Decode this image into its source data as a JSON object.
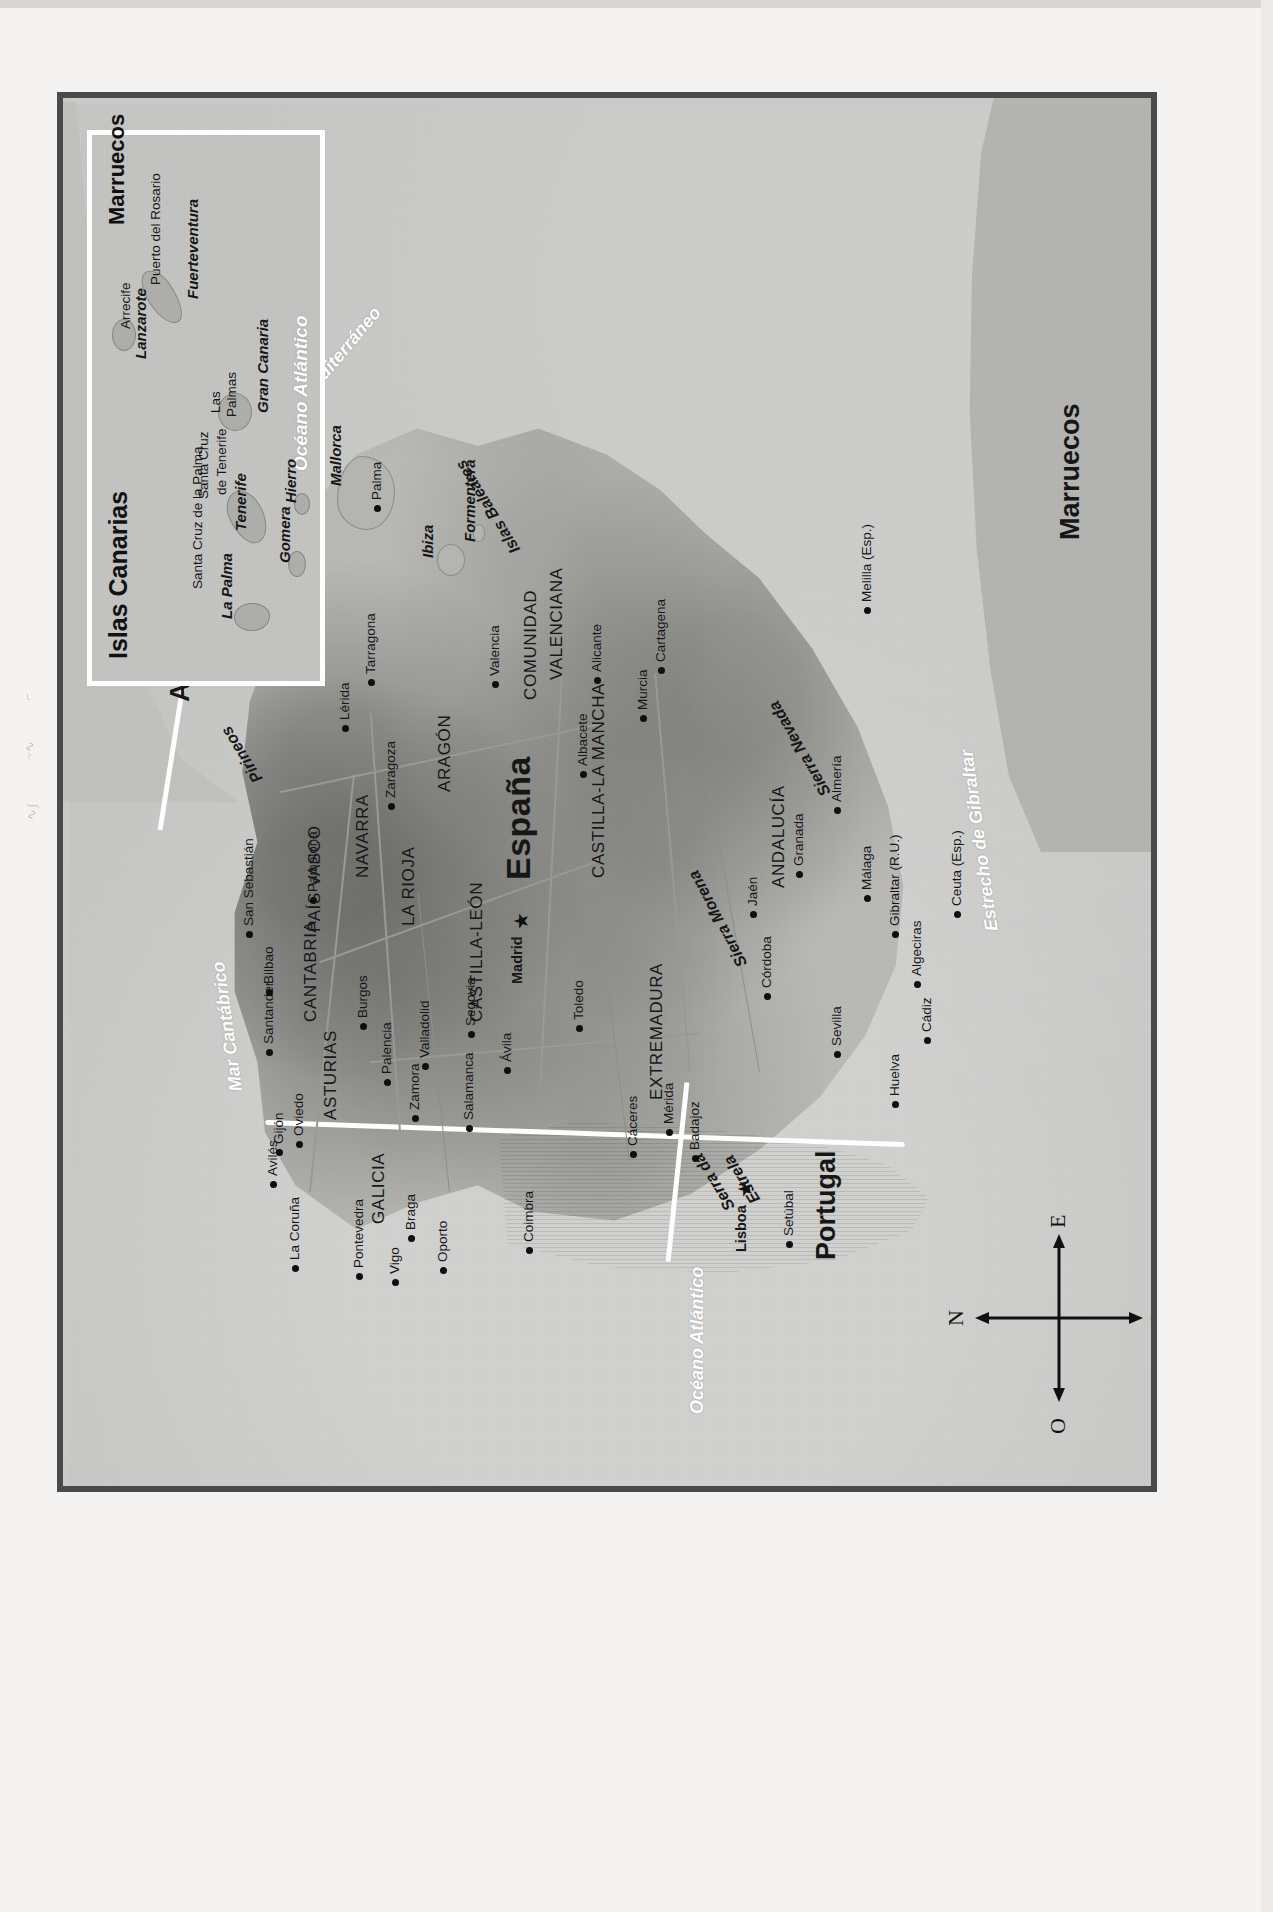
{
  "map": {
    "title": "Mapa físico-político de España y Portugal",
    "countries": [
      {
        "name": "España",
        "x": 612,
        "y": 430
      },
      {
        "name": "Portugal",
        "x": 232,
        "y": 742
      },
      {
        "name": "Andorra",
        "x": 790,
        "y": 96
      },
      {
        "name": "Marruecos",
        "x": 952,
        "y": 986
      }
    ],
    "regions": [
      {
        "name": "GALICIA",
        "x": 268,
        "y": 300
      },
      {
        "name": "ASTURIAS",
        "x": 372,
        "y": 252
      },
      {
        "name": "CANTABRIA",
        "x": 470,
        "y": 232
      },
      {
        "name": "PAÍS VASCO",
        "x": 560,
        "y": 236
      },
      {
        "name": "NAVARRA",
        "x": 614,
        "y": 284
      },
      {
        "name": "LA RIOJA",
        "x": 566,
        "y": 330
      },
      {
        "name": "ARAGÓN",
        "x": 700,
        "y": 366
      },
      {
        "name": "CATALUÑA",
        "x": 806,
        "y": 212
      },
      {
        "name": "CASTILLA-LEÓN",
        "x": 470,
        "y": 398
      },
      {
        "name": "COMUNIDAD",
        "x": 792,
        "y": 452
      },
      {
        "name": "VALENCIANA",
        "x": 812,
        "y": 478
      },
      {
        "name": "CASTILLA-LA MANCHA",
        "x": 614,
        "y": 520
      },
      {
        "name": "EXTREMADURA",
        "x": 392,
        "y": 578
      },
      {
        "name": "ANDALUCÍA",
        "x": 604,
        "y": 700
      }
    ],
    "features": [
      {
        "name": "Pirineos",
        "x": 706,
        "y": 164,
        "rot": -32
      },
      {
        "name": "Sierra Morena",
        "x": 520,
        "y": 640,
        "rot": -28
      },
      {
        "name": "Sierra Nevada",
        "x": 690,
        "y": 722,
        "rot": -30
      },
      {
        "name": "Serra da",
        "x": 278,
        "y": 636,
        "rot": -32
      },
      {
        "name": "Estrela",
        "x": 286,
        "y": 664,
        "rot": -32
      },
      {
        "name": "Islas Baleares",
        "x": 932,
        "y": 410,
        "rot": -32
      }
    ],
    "water_labels": [
      {
        "name": "Océano Atlántico",
        "x": 78,
        "y": 618,
        "rot": 0
      },
      {
        "name": "Mar Cantábrico",
        "x": 400,
        "y": 148,
        "rot": -8
      },
      {
        "name": "Mar Mediterráneo",
        "x": 1050,
        "y": 250,
        "rot": 40
      },
      {
        "name": "Estrecho de Gibraltar",
        "x": 560,
        "y": 900,
        "rot": -8
      }
    ],
    "islands": [
      {
        "name": "Menorca",
        "x": 1062,
        "y": 198
      },
      {
        "name": "Mallorca",
        "x": 1006,
        "y": 258
      },
      {
        "name": "Ibiza",
        "x": 934,
        "y": 350
      },
      {
        "name": "Formentera",
        "x": 950,
        "y": 392
      }
    ],
    "cities": [
      {
        "name": "La Coruña",
        "x": 232,
        "y": 218,
        "capital": false
      },
      {
        "name": "Pontevedra",
        "x": 224,
        "y": 282,
        "capital": false
      },
      {
        "name": "Vigo",
        "x": 218,
        "y": 318,
        "capital": false
      },
      {
        "name": "Oporto",
        "x": 230,
        "y": 366,
        "capital": false
      },
      {
        "name": "Braga",
        "x": 262,
        "y": 334,
        "capital": false
      },
      {
        "name": "Coimbra",
        "x": 250,
        "y": 452,
        "capital": false
      },
      {
        "name": "Lisboa",
        "x": 240,
        "y": 664,
        "capital": true
      },
      {
        "name": "Setúbal",
        "x": 256,
        "y": 712,
        "capital": false
      },
      {
        "name": "Avilés",
        "x": 316,
        "y": 196,
        "capital": false
      },
      {
        "name": "Gijón",
        "x": 348,
        "y": 202,
        "capital": false
      },
      {
        "name": "Oviedo",
        "x": 356,
        "y": 222,
        "capital": false
      },
      {
        "name": "Santander",
        "x": 448,
        "y": 192,
        "capital": false
      },
      {
        "name": "Bilbao",
        "x": 508,
        "y": 192,
        "capital": false
      },
      {
        "name": "San Sebastián",
        "x": 566,
        "y": 172,
        "capital": false
      },
      {
        "name": "Pamplona",
        "x": 600,
        "y": 236,
        "capital": false
      },
      {
        "name": "Burgos",
        "x": 474,
        "y": 286,
        "capital": false
      },
      {
        "name": "Palencia",
        "x": 418,
        "y": 310,
        "capital": false
      },
      {
        "name": "Valladolid",
        "x": 434,
        "y": 348,
        "capital": false
      },
      {
        "name": "Zamora",
        "x": 382,
        "y": 338,
        "capital": false
      },
      {
        "name": "Salamanca",
        "x": 372,
        "y": 392,
        "capital": false
      },
      {
        "name": "Segovia",
        "x": 466,
        "y": 394,
        "capital": false
      },
      {
        "name": "Ávila",
        "x": 430,
        "y": 430,
        "capital": false
      },
      {
        "name": "Madrid",
        "x": 508,
        "y": 440,
        "capital": true
      },
      {
        "name": "Toledo",
        "x": 472,
        "y": 502,
        "capital": false
      },
      {
        "name": "Zaragoza",
        "x": 694,
        "y": 314,
        "capital": false
      },
      {
        "name": "Lérida",
        "x": 772,
        "y": 268,
        "capital": false
      },
      {
        "name": "Barcelona",
        "x": 846,
        "y": 232,
        "capital": false
      },
      {
        "name": "Gerona",
        "x": 872,
        "y": 178,
        "capital": false
      },
      {
        "name": "Tarragona",
        "x": 818,
        "y": 294,
        "capital": false
      },
      {
        "name": "Valencia",
        "x": 816,
        "y": 418,
        "capital": false
      },
      {
        "name": "Albacete",
        "x": 726,
        "y": 506,
        "capital": false
      },
      {
        "name": "Alicante",
        "x": 820,
        "y": 520,
        "capital": false
      },
      {
        "name": "Murcia",
        "x": 782,
        "y": 566,
        "capital": false
      },
      {
        "name": "Cartagena",
        "x": 830,
        "y": 584,
        "capital": false
      },
      {
        "name": "Cáceres",
        "x": 346,
        "y": 556,
        "capital": false
      },
      {
        "name": "Mérida",
        "x": 368,
        "y": 592,
        "capital": false
      },
      {
        "name": "Badajoz",
        "x": 342,
        "y": 618,
        "capital": false
      },
      {
        "name": "Córdoba",
        "x": 504,
        "y": 690,
        "capital": false
      },
      {
        "name": "Jaén",
        "x": 586,
        "y": 676,
        "capital": false
      },
      {
        "name": "Granada",
        "x": 626,
        "y": 722,
        "capital": false
      },
      {
        "name": "Almería",
        "x": 690,
        "y": 760,
        "capital": false
      },
      {
        "name": "Málaga",
        "x": 602,
        "y": 790,
        "capital": false
      },
      {
        "name": "Sevilla",
        "x": 446,
        "y": 760,
        "capital": false
      },
      {
        "name": "Huelva",
        "x": 396,
        "y": 818,
        "capital": false
      },
      {
        "name": "Cádiz",
        "x": 460,
        "y": 850,
        "capital": false
      },
      {
        "name": "Algeciras",
        "x": 516,
        "y": 840,
        "capital": false
      },
      {
        "name": "Palma",
        "x": 992,
        "y": 300,
        "capital": false
      },
      {
        "name": "Gibraltar (R.U.)",
        "x": 566,
        "y": 818,
        "capital": false
      },
      {
        "name": "Ceuta (Esp.)",
        "x": 586,
        "y": 880,
        "capital": false
      },
      {
        "name": "Melilla (Esp.)",
        "x": 890,
        "y": 790,
        "capital": false
      }
    ],
    "compass": {
      "north": "N",
      "south": "S",
      "east": "E",
      "west": "O"
    }
  },
  "canary_inset": {
    "title": "Islas Canarias",
    "ocean_label": "Océano Atlántico",
    "morocco_label": "Marruecos",
    "islands": [
      {
        "name": "La Palma",
        "x": 62,
        "y": 126
      },
      {
        "name": "Tenerife",
        "x": 150,
        "y": 140
      },
      {
        "name": "Gomera",
        "x": 118,
        "y": 184
      },
      {
        "name": "Hierro",
        "x": 178,
        "y": 190
      },
      {
        "name": "Gran Canaria",
        "x": 268,
        "y": 162
      },
      {
        "name": "Fuerteventura",
        "x": 382,
        "y": 92
      },
      {
        "name": "Lanzarote",
        "x": 322,
        "y": 40
      }
    ],
    "cities": [
      {
        "name": "Santa Cruz de la Palma",
        "x": 92,
        "y": 98
      },
      {
        "name": "Santa Cruz",
        "x": 182,
        "y": 104
      },
      {
        "name": "de Tenerife",
        "x": 186,
        "y": 122
      },
      {
        "name": "Las",
        "x": 268,
        "y": 116
      },
      {
        "name": "Palmas",
        "x": 264,
        "y": 132
      },
      {
        "name": "Arrecife",
        "x": 352,
        "y": 26
      },
      {
        "name": "Puerto del Rosario",
        "x": 396,
        "y": 56
      }
    ]
  },
  "colors": {
    "frame": "#4a4a4a",
    "sea": "#c6c6c4",
    "land": "#b9b9b6",
    "border_white": "#ffffff",
    "text": "#171717",
    "paper": "#f4f3f1"
  }
}
